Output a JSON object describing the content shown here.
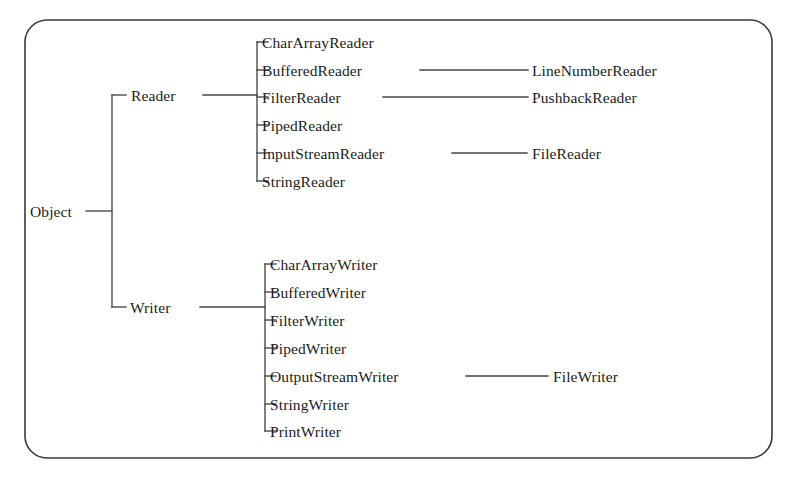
{
  "diagram": {
    "type": "tree",
    "frame": {
      "shape": "rounded-rectangle",
      "corner_radius": 22,
      "stroke_color": "#3a3a3a"
    },
    "line_color": "#454545",
    "text_color": "#1b1b1b",
    "root": {
      "label": "Object",
      "x": 30,
      "y": 211
    },
    "branches": [
      {
        "name": "reader-branch",
        "label": "Reader",
        "x": 131,
        "y": 95,
        "children": [
          {
            "label": "CharArrayReader",
            "x": 262,
            "y": 42,
            "extends_to": null
          },
          {
            "label": "BufferedReader",
            "x": 262,
            "y": 70,
            "extends_to": {
              "label": "LineNumberReader",
              "x": 532,
              "y": 70,
              "line_from": 420,
              "line_to": 528
            }
          },
          {
            "label": "FilterReader",
            "x": 262,
            "y": 97,
            "extends_to": {
              "label": "PushbackReader",
              "x": 532,
              "y": 97,
              "line_from": 383,
              "line_to": 528
            }
          },
          {
            "label": "PipedReader",
            "x": 262,
            "y": 125,
            "extends_to": null
          },
          {
            "label": "InputStreamReader",
            "x": 262,
            "y": 153,
            "extends_to": {
              "label": "FileReader",
              "x": 532,
              "y": 153,
              "line_from": 452,
              "line_to": 527
            }
          },
          {
            "label": "StringReader",
            "x": 262,
            "y": 181,
            "extends_to": null
          }
        ]
      },
      {
        "name": "writer-branch",
        "label": "Writer",
        "x": 130,
        "y": 307,
        "children": [
          {
            "label": "CharArrayWriter",
            "x": 270,
            "y": 264,
            "extends_to": null
          },
          {
            "label": "BufferedWriter",
            "x": 270,
            "y": 292,
            "extends_to": null
          },
          {
            "label": "FilterWriter",
            "x": 270,
            "y": 320,
            "extends_to": null
          },
          {
            "label": "PipedWriter",
            "x": 270,
            "y": 348,
            "extends_to": null
          },
          {
            "label": "OutputStreamWriter",
            "x": 270,
            "y": 376,
            "extends_to": {
              "label": "FileWriter",
              "x": 553,
              "y": 376,
              "line_from": 466,
              "line_to": 548
            }
          },
          {
            "label": "StringWriter",
            "x": 270,
            "y": 404,
            "extends_to": null
          },
          {
            "label": "PrintWriter",
            "x": 270,
            "y": 431,
            "extends_to": null
          }
        ]
      }
    ]
  }
}
